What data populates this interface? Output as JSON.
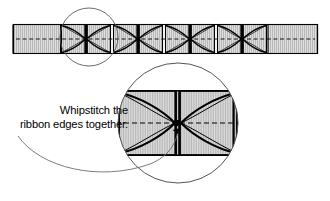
{
  "figure": {
    "background_color": "#ffffff",
    "line_color": "#000000",
    "ribbon_fill": "#dcdcdc",
    "hatch_color": "#9a9a9a",
    "detail_circle_stroke": "#555555",
    "callout": {
      "line_1": "Whipstitch the",
      "line_2": "ribbon edges together.",
      "align": "right",
      "x": 128,
      "y_line_1": 114,
      "y_line_2": 128
    },
    "band": {
      "x": 13,
      "y": 24,
      "width": 305,
      "height": 30,
      "center_line": "dashed",
      "plain_left_width": 48,
      "plain_right_width": 56
    },
    "motifs": {
      "count": 4,
      "label": "bowtie-gathered-ribbon-unit",
      "start_x": 61,
      "unit_width": 50,
      "gap": 2
    },
    "small_circle": {
      "label": "detail-region-marker",
      "cx": 89,
      "cy": 37,
      "r": 29
    },
    "magnified_circle": {
      "label": "magnified-detail-view",
      "cx": 178,
      "cy": 123,
      "r": 60,
      "magnification": "zoom"
    },
    "leader": {
      "label": "callout-leader-line",
      "arrow_target_x": 178,
      "arrow_target_y": 126
    }
  }
}
